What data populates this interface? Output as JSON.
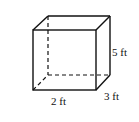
{
  "figure": {
    "shape": "rectangular prism",
    "labels": {
      "height": "5 ft",
      "depth": "3 ft",
      "width": "2 ft"
    },
    "colors": {
      "stroke": "#111111",
      "background": "#ffffff"
    }
  }
}
